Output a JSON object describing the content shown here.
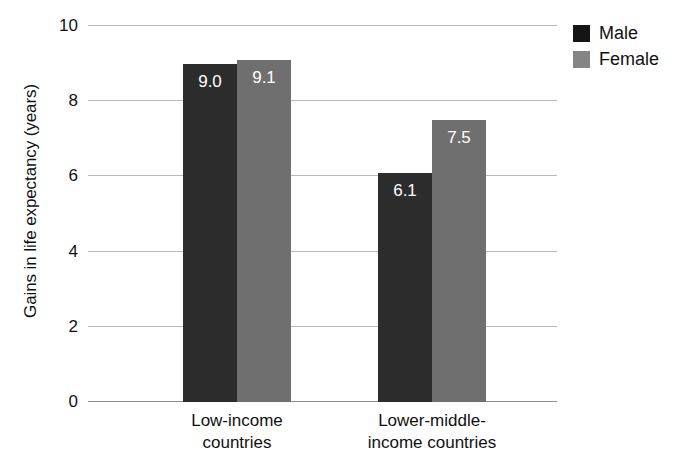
{
  "chart_data": {
    "type": "bar",
    "title": "",
    "xlabel": "",
    "ylabel": "Gains in life expectancy (years)",
    "categories": [
      "Low-income countries",
      "Lower-middle-income countries"
    ],
    "category_lines": [
      [
        "Low-income",
        "countries"
      ],
      [
        "Lower-middle-",
        "income countries"
      ]
    ],
    "series": [
      {
        "name": "Male",
        "values": [
          9.0,
          6.1
        ],
        "labels": [
          "9.0",
          "6.1"
        ],
        "color": "#2c2c2c"
      },
      {
        "name": "Female",
        "values": [
          9.1,
          7.5
        ],
        "labels": [
          "9.1",
          "7.5"
        ],
        "color": "#6f6f6f"
      }
    ],
    "ylim": [
      0,
      10
    ],
    "yticks": [
      0,
      2,
      4,
      6,
      8,
      10
    ],
    "ytick_labels": [
      "0",
      "2",
      "4",
      "6",
      "8",
      "10"
    ],
    "grid": true,
    "legend_position": "top-right"
  },
  "legend": {
    "entries": [
      {
        "label": "Male",
        "swatch": "male-swatch"
      },
      {
        "label": "Female",
        "swatch": "female-swatch"
      }
    ]
  }
}
